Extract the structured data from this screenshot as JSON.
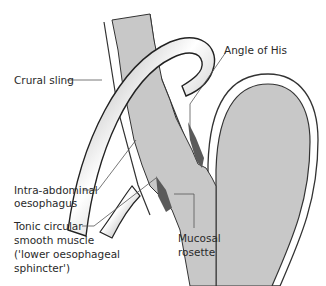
{
  "diagram": {
    "labels": {
      "crural_sling": "Crural sling",
      "angle_of_his": "Angle of His",
      "intra_abdominal_1": "Intra-abdominal",
      "intra_abdominal_2": "oesophagus",
      "tonic_1": "Tonic circular",
      "tonic_2": "smooth muscle",
      "tonic_3": "('lower oesophageal",
      "tonic_4": "sphincter')",
      "mucosal_1": "Mucosal",
      "mucosal_2": "rosette"
    },
    "colors": {
      "lumen_fill": "#c8c8c8",
      "muscle_dark": "#5a5a5a",
      "outline": "#333333",
      "leader_line": "#555555",
      "background": "#ffffff"
    }
  }
}
